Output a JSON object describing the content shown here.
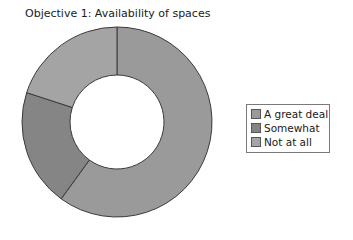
{
  "chart_data": {
    "type": "pie",
    "subtype": "donut",
    "title": "Objective 1: Availability of spaces",
    "categories": [
      "A great deal",
      "Somewhat",
      "Not at all"
    ],
    "values": [
      60,
      20,
      20
    ],
    "unit": "%",
    "colors": [
      "#9a9a9a",
      "#858585",
      "#a4a4a4"
    ],
    "start_angle_deg": 0,
    "direction": "clockwise",
    "legend_position": "right"
  },
  "legend": {
    "items": [
      {
        "label": "A great deal",
        "color": "#9a9a9a"
      },
      {
        "label": "Somewhat",
        "color": "#858585"
      },
      {
        "label": "Not at all",
        "color": "#a4a4a4"
      }
    ]
  }
}
